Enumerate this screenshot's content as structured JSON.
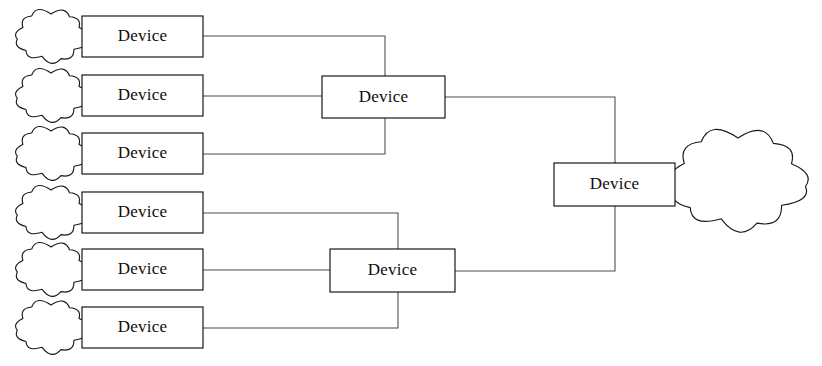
{
  "diagram": {
    "background_color": "#ffffff",
    "line_color": "#4a4a4a",
    "box_stroke_color": "#111111",
    "box_fill_color": "#ffffff",
    "text_color": "#0d0d0d",
    "edge_nodes": [
      {
        "id": "edge-1",
        "label": "Device",
        "x": 82,
        "y": 16,
        "w": 121,
        "h": 41,
        "cloud": "cloud-1"
      },
      {
        "id": "edge-2",
        "label": "Device",
        "x": 82,
        "y": 75,
        "w": 121,
        "h": 41,
        "cloud": "cloud-2"
      },
      {
        "id": "edge-3",
        "label": "Device",
        "x": 82,
        "y": 133,
        "w": 121,
        "h": 41,
        "cloud": "cloud-3"
      },
      {
        "id": "edge-4",
        "label": "Device",
        "x": 82,
        "y": 192,
        "w": 121,
        "h": 41,
        "cloud": "cloud-4"
      },
      {
        "id": "edge-5",
        "label": "Device",
        "x": 82,
        "y": 249,
        "w": 121,
        "h": 41,
        "cloud": "cloud-5"
      },
      {
        "id": "edge-6",
        "label": "Device",
        "x": 82,
        "y": 307,
        "w": 121,
        "h": 41,
        "cloud": "cloud-6"
      }
    ],
    "aggregator_nodes": [
      {
        "id": "agg-upper",
        "label": "Device",
        "x": 322,
        "y": 76,
        "w": 123,
        "h": 42
      },
      {
        "id": "agg-lower",
        "label": "Device",
        "x": 330,
        "y": 249,
        "w": 125,
        "h": 43
      }
    ],
    "core_node": {
      "id": "core",
      "label": "Device",
      "x": 554,
      "y": 163,
      "w": 121,
      "h": 43
    },
    "clouds": [
      {
        "id": "cloud-1",
        "cx": 51,
        "cy": 36,
        "rx": 33,
        "ry": 22,
        "size": "small"
      },
      {
        "id": "cloud-2",
        "cx": 51,
        "cy": 95,
        "rx": 33,
        "ry": 22,
        "size": "small"
      },
      {
        "id": "cloud-3",
        "cx": 51,
        "cy": 153,
        "rx": 33,
        "ry": 22,
        "size": "small"
      },
      {
        "id": "cloud-4",
        "cx": 51,
        "cy": 212,
        "rx": 33,
        "ry": 22,
        "size": "small"
      },
      {
        "id": "cloud-5",
        "cx": 51,
        "cy": 269,
        "rx": 33,
        "ry": 22,
        "size": "small"
      },
      {
        "id": "cloud-6",
        "cx": 51,
        "cy": 327,
        "rx": 33,
        "ry": 22,
        "size": "small"
      },
      {
        "id": "cloud-core",
        "cx": 738,
        "cy": 180,
        "rx": 63,
        "ry": 42,
        "size": "large"
      }
    ],
    "links": [
      {
        "id": "link-edge1-bus-upper",
        "from": "edge-1",
        "to": "agg-upper",
        "path": "M203,36 L385,36 L385,76"
      },
      {
        "id": "link-edge2-agg-upper",
        "from": "edge-2",
        "to": "agg-upper",
        "path": "M203,96 L322,96"
      },
      {
        "id": "link-edge3-bus-upper",
        "from": "edge-3",
        "to": "agg-upper",
        "path": "M203,154 L385,154 L385,118"
      },
      {
        "id": "link-edge4-bus-lower",
        "from": "edge-4",
        "to": "agg-lower",
        "path": "M203,213 L398,213 L398,249"
      },
      {
        "id": "link-edge5-agg-lower",
        "from": "edge-5",
        "to": "agg-lower",
        "path": "M203,270 L330,270"
      },
      {
        "id": "link-edge6-bus-lower",
        "from": "edge-6",
        "to": "agg-lower",
        "path": "M203,328 L398,328 L398,292"
      },
      {
        "id": "link-agg-upper-core",
        "from": "agg-upper",
        "to": "core",
        "path": "M445,97 L615,97 L615,163"
      },
      {
        "id": "link-agg-lower-core",
        "from": "agg-lower",
        "to": "core",
        "path": "M455,271 L615,271 L615,206"
      },
      {
        "id": "link-core-trunk",
        "from": "core",
        "to": "core",
        "path": "M615,163 L615,206"
      }
    ]
  }
}
